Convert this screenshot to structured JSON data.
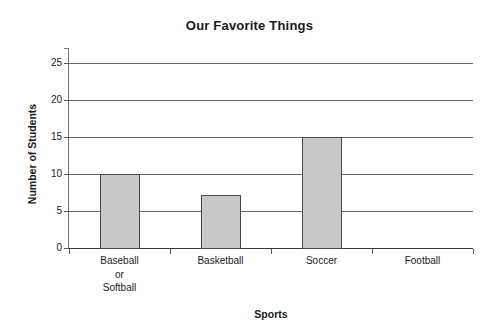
{
  "chart_data": {
    "type": "bar",
    "title": "Our Favorite Things",
    "xlabel": "Sports",
    "ylabel": "Number of Students",
    "categories": [
      "Baseball or Softball",
      "Basketball",
      "Soccer",
      "Football"
    ],
    "category_label_lines": [
      [
        "Baseball",
        "or",
        "Softball"
      ],
      [
        "Basketball"
      ],
      [
        "Soccer"
      ],
      [
        "Football"
      ]
    ],
    "values": [
      10,
      7.2,
      15,
      0
    ],
    "ylim": [
      0,
      27
    ],
    "yticks": [
      0,
      5,
      10,
      15,
      20,
      25
    ],
    "ytick_labels": [
      "0",
      "5",
      "10",
      "15",
      "20",
      "25"
    ],
    "grid": true,
    "legend": "none",
    "bar_fill_color": "#c8c8c8",
    "bar_border_color": "#4a4a4a",
    "gridline_color": "#6b6b6b",
    "axis_color": "#3a3a3a",
    "background_color": "#ffffff",
    "text_color": "#1a1a1a"
  }
}
